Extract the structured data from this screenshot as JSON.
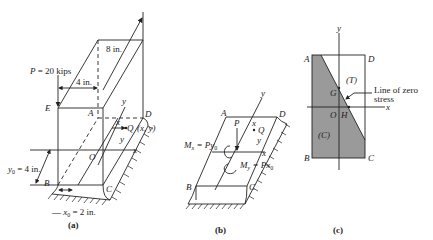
{
  "figure_a": {
    "caption": "(a)",
    "load_label": "P = 20 kips",
    "dim_8in": "8 in.",
    "dim_4in": "4 in.",
    "y0_label": "y",
    "y0_sub": "0",
    "y0_value": " = 4 in.",
    "x0_label": "x",
    "x0_sub": "0",
    "x0_value": " = 2 in.",
    "point_E": "E",
    "point_A": "A",
    "point_D": "D",
    "point_B": "B",
    "point_C": "C",
    "point_O": "O",
    "point_Q": "Q",
    "point_Q_coords": "(x, y)",
    "axis_x": "x",
    "axis_y": "y",
    "small_x": "x",
    "small_y": "y"
  },
  "figure_b": {
    "caption": "(b)",
    "load_label": "P",
    "moment_x_label": "M",
    "moment_x_sub": "x",
    "moment_x_value": " = Py",
    "moment_x_value_sub": "0",
    "moment_y_label": "M",
    "moment_y_sub": "y",
    "moment_y_value": " = Px",
    "moment_y_value_sub": "0",
    "point_A": "A",
    "point_D": "D",
    "point_B": "B",
    "point_C": "C",
    "point_Q": "Q",
    "axis_x": "x",
    "axis_y": "y",
    "small_x": "x",
    "small_y": "y"
  },
  "figure_c": {
    "caption": "(c)",
    "point_A": "A",
    "point_D": "D",
    "point_B": "B",
    "point_C": "C",
    "point_O": "O",
    "point_G": "G",
    "point_H": "H",
    "tension_label": "(T)",
    "compression_label": "(C)",
    "zero_stress_line1": "Line of zero",
    "zero_stress_line2": "stress",
    "axis_x": "x",
    "axis_y": "y",
    "shade_color": "#9a9a9a"
  }
}
